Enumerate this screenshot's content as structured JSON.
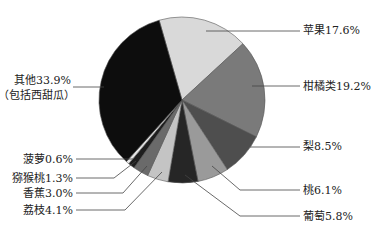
{
  "chart_data": {
    "type": "pie",
    "title": "",
    "start_angle_deg": -16,
    "direction": "clockwise",
    "slices": [
      {
        "label": "苹果",
        "value": 17.6,
        "display": "苹果17.6%",
        "color": "#d9d9d9"
      },
      {
        "label": "柑橘类",
        "value": 19.2,
        "display": "柑橘类19.2%",
        "color": "#7a7a7a"
      },
      {
        "label": "梨",
        "value": 8.5,
        "display": "梨8.5%",
        "color": "#4e4e4e"
      },
      {
        "label": "桃",
        "value": 6.1,
        "display": "桃6.1%",
        "color": "#9a9a9a"
      },
      {
        "label": "葡萄",
        "value": 5.8,
        "display": "葡萄5.8%",
        "color": "#262626"
      },
      {
        "label": "荔枝",
        "value": 4.1,
        "display": "荔枝4.1%",
        "color": "#c4c4c4"
      },
      {
        "label": "香蕉",
        "value": 3.0,
        "display": "香蕉3.0%",
        "color": "#6a6a6a"
      },
      {
        "label": "猕猴桃",
        "value": 1.3,
        "display": "猕猴桃1.3%",
        "color": "#1e1e1e"
      },
      {
        "label": "菠萝",
        "value": 0.6,
        "display": "菠萝0.6%",
        "color": "#e6e6e6"
      },
      {
        "label": "其他（包括西甜瓜）",
        "value": 33.9,
        "display": "其他33.9%",
        "display_line2": "（包括西甜瓜）",
        "color": "#0d0d0d"
      }
    ],
    "legend": "none (leader-line labels)"
  },
  "labels": {
    "apple": "苹果17.6%",
    "citrus": "柑橘类19.2%",
    "pear": "梨8.5%",
    "peach": "桃6.1%",
    "grape": "葡萄5.8%",
    "lychee": "荔枝4.1%",
    "banana": "香蕉3.0%",
    "kiwi": "猕猴桃1.3%",
    "pineapple": "菠萝0.6%",
    "others_line1": "其他33.9%",
    "others_line2": "（包括西甜瓜）"
  }
}
